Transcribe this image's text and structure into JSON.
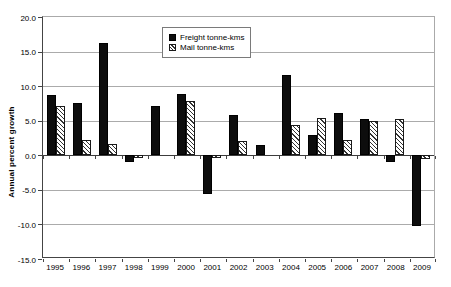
{
  "chart_data": {
    "type": "bar",
    "title": "",
    "xlabel": "",
    "ylabel": "Annual percent growth",
    "ylim": [
      -15,
      20
    ],
    "yticks": [
      20,
      15,
      10,
      5,
      0,
      -5,
      -10,
      -15
    ],
    "ytick_decimals": 1,
    "grid": true,
    "legend_position": "top-center",
    "categories": [
      "1995",
      "1996",
      "1997",
      "1998",
      "1999",
      "2000",
      "2001",
      "2002",
      "2003",
      "2004",
      "2005",
      "2006",
      "2007",
      "2008",
      "2009"
    ],
    "series": [
      {
        "name": "Freight tonne-kms",
        "style": "solid-black",
        "values": [
          8.7,
          7.5,
          16.2,
          -0.9,
          7.2,
          8.8,
          -5.6,
          5.8,
          1.5,
          11.6,
          2.9,
          6.1,
          5.2,
          -1.0,
          -10.3
        ]
      },
      {
        "name": "Mail tonne-kms",
        "style": "diagonal-hatch",
        "values": [
          7.1,
          2.2,
          1.7,
          -0.4,
          0,
          7.8,
          -0.4,
          2.0,
          0,
          4.4,
          5.4,
          2.2,
          5.0,
          5.3,
          -0.5
        ]
      }
    ]
  },
  "colors": {
    "background": "#ffffff",
    "gridline": "#ababab",
    "axis": "#444444",
    "plot_border": "#aaaaaa",
    "freight_bar": "#0d0d0d",
    "mail_hatch": "#333333",
    "legend_border": "#7a7a7a"
  }
}
